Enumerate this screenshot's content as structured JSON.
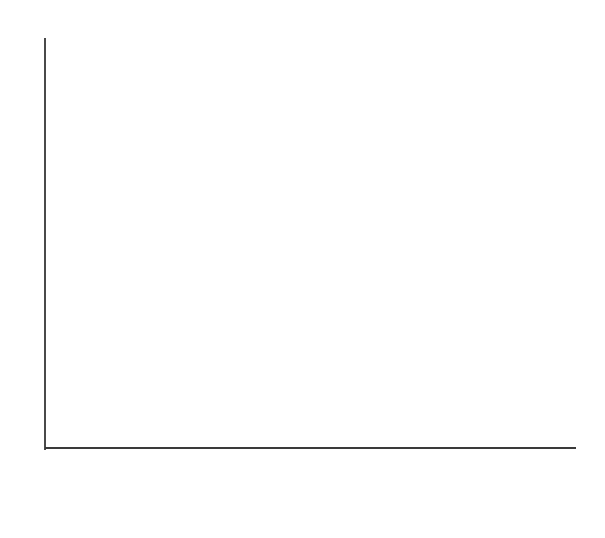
{
  "chart_data": {
    "type": "bar",
    "title": "",
    "subtitle": "",
    "xlabel": "",
    "ylabel": "",
    "categories": [
      "Phase I Conceptualization",
      "Phase II Planning",
      "Phase III Execution",
      "Phase IV Termination"
    ],
    "category_lines": [
      {
        "line1": "Phase I",
        "line2": "Conceptualization"
      },
      {
        "line1": "Phase II",
        "line2": "Planning"
      },
      {
        "line1": "Phase III",
        "line2": "Execution"
      },
      {
        "line1": "Phase IV",
        "line2": "Termination"
      }
    ],
    "values": [
      1,
      3,
      7,
      2
    ],
    "ylim": [
      0,
      8
    ],
    "y_tick_count": 9,
    "y_tick_values": [
      0,
      1,
      2,
      3,
      4,
      5,
      6,
      7,
      8
    ],
    "y_tick_labels": [
      "",
      "",
      "",
      "",
      "",
      "",
      "",
      "",
      ""
    ],
    "x_tick_labels_shown": false,
    "grid": false,
    "legend": null,
    "annotations": [],
    "bar_fill_color": "#cdcdcd",
    "bar_edge_color": "#4d4d4d",
    "axis_color": "#4a4a4a",
    "background_color": "#ffffff",
    "bars_contiguous": true
  },
  "figure": {
    "width": 605,
    "height": 538,
    "plot_left": 45,
    "plot_right": 575,
    "plot_top": 38,
    "baseline_y": 448,
    "bar_boundaries_x": [
      45,
      176,
      308,
      443,
      575
    ],
    "bar_top_y": [
      395,
      294,
      88,
      344
    ],
    "y_tick_y": [
      38,
      89,
      140,
      191,
      243,
      294,
      345,
      396,
      448
    ],
    "x_tick_x": [
      45,
      176,
      308,
      443,
      575
    ]
  }
}
